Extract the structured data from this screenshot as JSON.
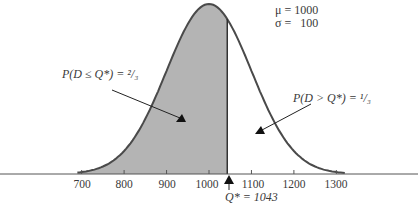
{
  "chart_data": {
    "type": "area",
    "title": "",
    "distribution": "normal",
    "params": {
      "mu": 1000,
      "sigma": 100
    },
    "xlabel": "",
    "ylabel": "",
    "xlim": [
      620,
      1440
    ],
    "x_ticks": [
      700,
      800,
      900,
      1000,
      1100,
      1200,
      1300
    ],
    "grid": false,
    "shaded_region": {
      "from": 700,
      "to": 1043,
      "probability": "2/3"
    },
    "unshaded_region": {
      "from": 1043,
      "to": 1300,
      "probability": "1/3"
    },
    "critical_value": {
      "name": "Q*",
      "value": 1043
    },
    "annotations": [
      {
        "text": "μ = 1000"
      },
      {
        "text": "σ =   100"
      },
      {
        "text": "P(D ≤ Q*) = 2/3"
      },
      {
        "text": "P(D > Q*) = 1/3"
      },
      {
        "text": "Q* = 1043"
      }
    ]
  },
  "labels": {
    "mu_line": "μ = 1000",
    "sigma_line": "σ =   100",
    "left_prob": "P(D ≤ Q*) = ²/₃",
    "right_prob": "P(D > Q*) = ¹/₃",
    "q_star": "Q* = 1043",
    "ticks": [
      "700",
      "800",
      "900",
      "1000",
      "1100",
      "1200",
      "1300"
    ]
  },
  "colors": {
    "shade": "#b4b4b4",
    "curve": "#4a4a4a",
    "axis": "#555555",
    "arrow": "#222222"
  }
}
